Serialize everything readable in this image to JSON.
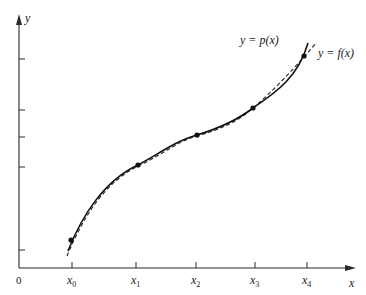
{
  "figure": {
    "axes": {
      "x_label": "x",
      "y_label": "y",
      "origin_label": "0"
    },
    "x_ticks": [
      {
        "label_base": "x",
        "label_sub": "0"
      },
      {
        "label_base": "x",
        "label_sub": "1"
      },
      {
        "label_base": "x",
        "label_sub": "2"
      },
      {
        "label_base": "x",
        "label_sub": "3"
      },
      {
        "label_base": "x",
        "label_sub": "4"
      }
    ],
    "curves": {
      "p_label": "y = p(x)",
      "f_label": "y = f(x)",
      "p_style": "solid",
      "f_style": "dashed"
    },
    "interpolation_points": 5,
    "y_tick_count": 5
  }
}
